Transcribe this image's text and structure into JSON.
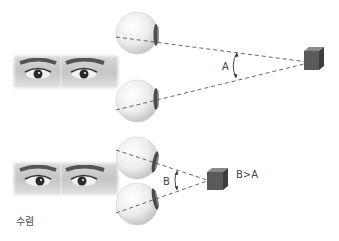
{
  "diagram": {
    "topic": "convergence",
    "caption": "수렴",
    "panels": [
      {
        "id": "far",
        "angle_label": "A",
        "target": "cube",
        "target_distance": "far"
      },
      {
        "id": "near",
        "angle_label": "B",
        "target": "cube",
        "target_distance": "near",
        "comparison_label": "B>A"
      }
    ],
    "colors": {
      "cube_front": "#555555",
      "cube_top": "#7a7a7a",
      "cube_side": "#3e3e3e",
      "dash_line": "#555555",
      "eyeball": "#e8e8e8"
    }
  }
}
